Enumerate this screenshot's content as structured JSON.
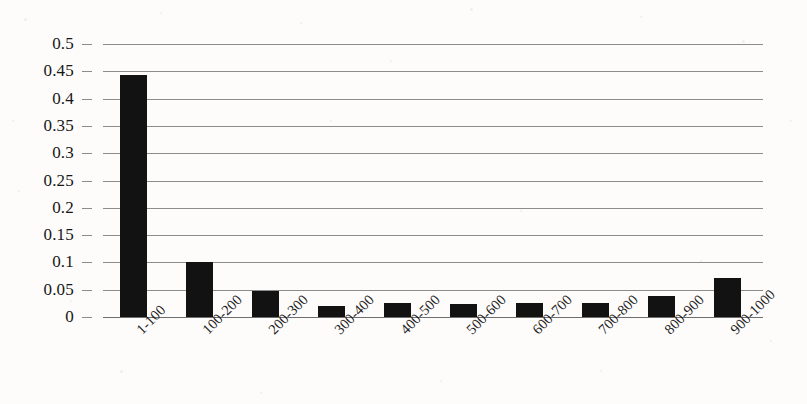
{
  "chart_data": {
    "type": "bar",
    "title": "",
    "subtitle": "",
    "xlabel": "",
    "ylabel": "",
    "categories": [
      "1-100",
      "100-200",
      "200-300",
      "300-400",
      "400-500",
      "500-600",
      "600-700",
      "700-800",
      "800-900",
      "900-1000"
    ],
    "values": [
      0.443,
      0.1,
      0.048,
      0.02,
      0.025,
      0.023,
      0.026,
      0.025,
      0.038,
      0.071
    ],
    "ylim": [
      0,
      0.5
    ],
    "ytick_labels": [
      "0.5",
      "0.45",
      "0.4",
      "0.35",
      "0.3",
      "0.25",
      "0.2",
      "0.15",
      "0.1",
      "0.05",
      "0"
    ],
    "ytick_values": [
      0.5,
      0.45,
      0.4,
      0.35,
      0.3,
      0.25,
      0.2,
      0.15,
      0.1,
      0.05,
      0
    ],
    "grid": true,
    "legend": false,
    "legend_position": "none",
    "bar_color": "#121212",
    "gridline_color": "#8c8c8c",
    "background_color": "#fdfcfa",
    "xtick_rotation": -45
  }
}
